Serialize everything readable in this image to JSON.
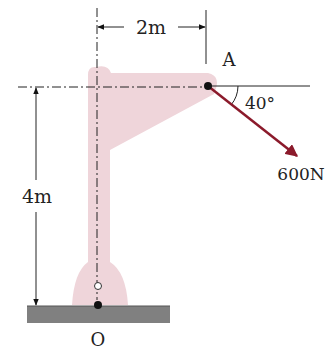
{
  "diagram": {
    "type": "statics-free-body",
    "labels": {
      "point_a": "A",
      "point_o": "O",
      "horizontal_dimension": "2m",
      "vertical_dimension": "4m",
      "angle": "40°",
      "force": "600N"
    },
    "colors": {
      "bracket_fill": "#efd5da",
      "force_arrow": "#8b1a2b",
      "ground": "#808080",
      "lines": "#222222"
    }
  }
}
